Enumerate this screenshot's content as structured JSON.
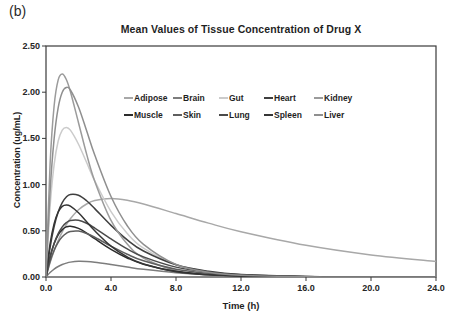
{
  "figure_label": "(b)",
  "colors": {
    "axis": "#3a3a3a",
    "text": "#1f1f1f",
    "background": "#ffffff"
  },
  "chart_data": {
    "type": "line",
    "title": "Mean Values of Tissue Concentration of Drug X",
    "xlabel": "Time (h)",
    "ylabel": "Concentration (ug/mL)",
    "xlim": [
      0,
      24
    ],
    "ylim": [
      0,
      2.5
    ],
    "x_ticks": [
      0,
      4,
      8,
      12,
      16,
      20,
      24
    ],
    "x_tick_labels": [
      "0.0",
      "4.0",
      "8.0",
      "12.0",
      "16.0",
      "20.0",
      "24.0"
    ],
    "y_ticks": [
      0,
      0.5,
      1.0,
      1.5,
      2.0,
      2.5
    ],
    "y_tick_labels": [
      "0.00",
      "0.50",
      "1.00",
      "1.50",
      "2.00",
      "2.50"
    ],
    "grid": false,
    "legend_position": "inside-top-center",
    "x": [
      0,
      0.25,
      0.5,
      0.75,
      1,
      1.25,
      1.5,
      2,
      2.5,
      3,
      4,
      5,
      6,
      8,
      10,
      12,
      16,
      20,
      24
    ],
    "series": [
      {
        "name": "Adipose",
        "color": "#a8a8a8",
        "values": [
          0,
          0.154,
          0.284,
          0.395,
          0.488,
          0.566,
          0.631,
          0.728,
          0.79,
          0.827,
          0.85,
          0.831,
          0.79,
          0.687,
          0.583,
          0.49,
          0.343,
          0.239,
          0.167
        ]
      },
      {
        "name": "Brain",
        "color": "#7d7d7d",
        "values": [
          0,
          0.048,
          0.086,
          0.114,
          0.135,
          0.15,
          0.161,
          0.17,
          0.168,
          0.16,
          0.135,
          0.108,
          0.083,
          0.046,
          0.024,
          0.012,
          0.003,
          0.001,
          0
        ]
      },
      {
        "name": "Gut",
        "color": "#cbcbcb",
        "values": [
          0,
          0.758,
          1.217,
          1.472,
          1.59,
          1.619,
          1.589,
          1.437,
          1.239,
          1.041,
          0.708,
          0.471,
          0.312,
          0.135,
          0.058,
          0.025,
          0.005,
          0.001,
          0
        ]
      },
      {
        "name": "Heart",
        "color": "#3f3f3f",
        "values": [
          0,
          0.319,
          0.547,
          0.704,
          0.806,
          0.866,
          0.894,
          0.885,
          0.825,
          0.74,
          0.559,
          0.402,
          0.281,
          0.132,
          0.061,
          0.027,
          0.006,
          0.001,
          0
        ]
      },
      {
        "name": "Kidney",
        "color": "#9b9b9b",
        "values": [
          0,
          1.214,
          1.853,
          2.134,
          2.198,
          2.138,
          2.008,
          1.67,
          1.33,
          1.037,
          0.612,
          0.356,
          0.206,
          0.069,
          0.023,
          0.008,
          0.001,
          0,
          0
        ]
      },
      {
        "name": "Muscle",
        "color": "#2b2b2b",
        "values": [
          0,
          0.216,
          0.362,
          0.457,
          0.513,
          0.542,
          0.55,
          0.526,
          0.476,
          0.415,
          0.299,
          0.206,
          0.139,
          0.061,
          0.027,
          0.012,
          0.002,
          0,
          0
        ]
      },
      {
        "name": "Skin",
        "color": "#5e5e5e",
        "values": [
          0,
          0.167,
          0.289,
          0.376,
          0.435,
          0.472,
          0.493,
          0.497,
          0.471,
          0.43,
          0.334,
          0.246,
          0.175,
          0.084,
          0.039,
          0.018,
          0.004,
          0.001,
          0
        ]
      },
      {
        "name": "Lung",
        "color": "#4a4a4a",
        "values": [
          0,
          0.21,
          0.363,
          0.47,
          0.543,
          0.588,
          0.612,
          0.615,
          0.582,
          0.53,
          0.412,
          0.304,
          0.218,
          0.107,
          0.052,
          0.024,
          0.005,
          0.001,
          0
        ]
      },
      {
        "name": "Spleen",
        "color": "#353535",
        "values": [
          0,
          0.358,
          0.578,
          0.703,
          0.764,
          0.78,
          0.767,
          0.695,
          0.598,
          0.5,
          0.334,
          0.217,
          0.141,
          0.057,
          0.023,
          0.009,
          0.002,
          0,
          0
        ]
      },
      {
        "name": "Liver",
        "color": "#8f8f8f",
        "values": [
          0,
          0.92,
          1.497,
          1.833,
          2.0,
          2.051,
          2.024,
          1.84,
          1.583,
          1.32,
          0.871,
          0.555,
          0.353,
          0.135,
          0.052,
          0.02,
          0.003,
          0.001,
          0
        ]
      }
    ]
  }
}
